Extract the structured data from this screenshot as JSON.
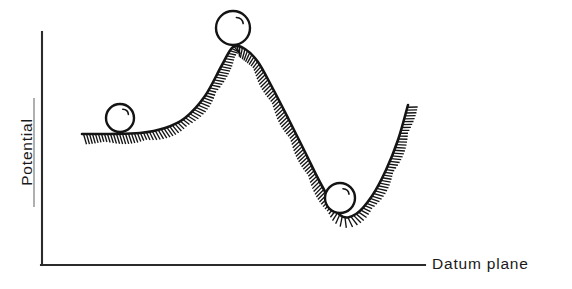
{
  "figure": {
    "kind": "potential-energy-curve-diagram",
    "background_color": "#ffffff",
    "ink_color": "#141414",
    "axis_color": "#2b2b2b",
    "width": 572,
    "height": 289
  },
  "axes": {
    "y_axis": {
      "label": "Potential",
      "orientation": "vertical",
      "rotation_degrees": -90,
      "x": 42,
      "y_top": 32,
      "y_bottom": 265,
      "has_ticks": false,
      "has_tick_labels": false
    },
    "x_axis": {
      "label": "Datum plane",
      "orientation": "horizontal",
      "y": 265,
      "x_left": 42,
      "x_right": 425,
      "has_ticks": false,
      "has_tick_labels": false
    }
  },
  "labels": {
    "y_axis_label": "Potential",
    "x_axis_label": "Datum plane"
  },
  "chart_data": {
    "type": "line",
    "title": "",
    "subtitle": "",
    "xlabel": "Datum plane",
    "ylabel": "Potential",
    "grid": false,
    "legend": "none",
    "xlim": [
      42,
      425
    ],
    "ylim": [
      265,
      32
    ],
    "axis_units": "pixels (unlabeled schematic axes)",
    "series": [
      {
        "name": "potential-energy-curve",
        "description": "Hatched potential energy surface: flat plateau, barrier maximum, deep minimum, rising right wall",
        "x": [
          82,
          110,
          140,
          165,
          185,
          205,
          222,
          233,
          245,
          258,
          272,
          288,
          305,
          322,
          340,
          356,
          372,
          386,
          398,
          408
        ],
        "y": [
          134,
          134,
          133,
          128,
          118,
          96,
          65,
          47,
          49,
          62,
          87,
          118,
          152,
          186,
          215,
          214,
          196,
          170,
          140,
          105
        ]
      }
    ],
    "annotations": [
      {
        "name": "ball-on-plateau",
        "label": "sphere resting on flat plateau (metastable)",
        "x": 120,
        "y": 118,
        "radius": 14
      },
      {
        "name": "ball-at-peak",
        "label": "sphere balanced at barrier maximum (unstable)",
        "x": 233,
        "y": 28,
        "radius": 17
      },
      {
        "name": "ball-in-valley",
        "label": "sphere settled in potential well (stable)",
        "x": 340,
        "y": 198,
        "radius": 15
      }
    ],
    "features": {
      "plateau_level_y": 134,
      "barrier_peak": {
        "x": 233,
        "y": 47
      },
      "well_minimum": {
        "x": 340,
        "y": 215
      },
      "right_wall_end": {
        "x": 408,
        "y": 105
      },
      "hatching": "short perpendicular ticks drawn on the underside of the curve along its entire length"
    }
  }
}
